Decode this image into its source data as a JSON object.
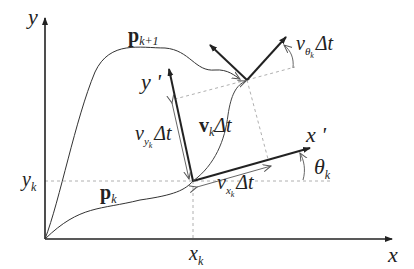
{
  "diagram": {
    "title": "",
    "colors": {
      "line": "#222222",
      "thin": "#555555",
      "dashed": "#aaaaaa",
      "background": "#ffffff"
    },
    "labels": {
      "y_axis": "y",
      "x_axis": "x",
      "y_k": "y",
      "y_k_sub": "k",
      "x_k": "x",
      "x_k_sub": "k",
      "p_k": "p",
      "p_k_sub": "k",
      "p_k1": "p",
      "p_k1_sub": "k+1",
      "y_prime": "y '",
      "x_prime": "x '",
      "v_k": "v",
      "v_k_sub": "k",
      "v_k_dt": "Δt",
      "v_yk": "v",
      "v_yk_sub": "y",
      "v_yk_subsub": "k",
      "v_yk_dt": "Δt",
      "v_xk": "v",
      "v_xk_sub": "x",
      "v_xk_subsub": "k",
      "v_xk_dt": "Δt",
      "v_theta": "v",
      "v_theta_sub": "θ",
      "v_theta_subsub": "k",
      "v_theta_dt": "Δt",
      "theta_k": "θ",
      "theta_k_sub": "k"
    }
  }
}
